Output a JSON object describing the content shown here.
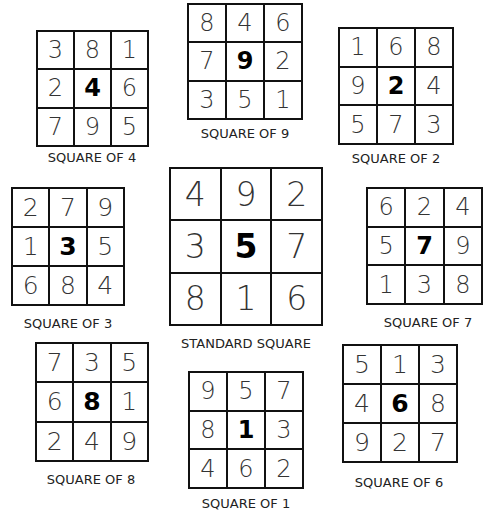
{
  "squares": [
    {
      "id": "square-of-4",
      "label": "SQUARE OF 4",
      "center": 4,
      "cells": [
        "3",
        "8",
        "1",
        "2",
        "4",
        "6",
        "7",
        "9",
        "5"
      ],
      "box": {
        "x": 36,
        "y": 30,
        "w": 113,
        "h": 117
      },
      "label_pos": {
        "x": 92,
        "y": 150
      }
    },
    {
      "id": "square-of-9",
      "label": "SQUARE OF 9",
      "center": 9,
      "cells": [
        "8",
        "4",
        "6",
        "7",
        "9",
        "2",
        "3",
        "5",
        "1"
      ],
      "box": {
        "x": 187,
        "y": 3,
        "w": 116,
        "h": 117
      },
      "label_pos": {
        "x": 245,
        "y": 126
      }
    },
    {
      "id": "square-of-2",
      "label": "SQUARE OF 2",
      "center": 2,
      "cells": [
        "1",
        "6",
        "8",
        "9",
        "2",
        "4",
        "5",
        "7",
        "3"
      ],
      "box": {
        "x": 338,
        "y": 27,
        "w": 116,
        "h": 118
      },
      "label_pos": {
        "x": 396,
        "y": 151
      }
    },
    {
      "id": "square-of-3",
      "label": "SQUARE OF 3",
      "center": 3,
      "cells": [
        "2",
        "7",
        "9",
        "1",
        "3",
        "5",
        "6",
        "8",
        "4"
      ],
      "box": {
        "x": 11,
        "y": 187,
        "w": 114,
        "h": 119
      },
      "label_pos": {
        "x": 68,
        "y": 316
      }
    },
    {
      "id": "standard-square",
      "label": "STANDARD SQUARE",
      "center": 5,
      "cells": [
        "4",
        "9",
        "2",
        "3",
        "5",
        "7",
        "8",
        "1",
        "6"
      ],
      "box": {
        "x": 169,
        "y": 167,
        "w": 154,
        "h": 159
      },
      "label_pos": {
        "x": 246,
        "y": 336
      }
    },
    {
      "id": "square-of-7",
      "label": "SQUARE OF 7",
      "center": 7,
      "cells": [
        "6",
        "2",
        "4",
        "5",
        "7",
        "9",
        "1",
        "3",
        "8"
      ],
      "box": {
        "x": 366,
        "y": 187,
        "w": 117,
        "h": 118
      },
      "label_pos": {
        "x": 428,
        "y": 315
      }
    },
    {
      "id": "square-of-8",
      "label": "SQUARE OF 8",
      "center": 8,
      "cells": [
        "7",
        "3",
        "5",
        "6",
        "8",
        "1",
        "2",
        "4",
        "9"
      ],
      "box": {
        "x": 35,
        "y": 342,
        "w": 114,
        "h": 120
      },
      "label_pos": {
        "x": 91,
        "y": 472
      }
    },
    {
      "id": "square-of-1",
      "label": "SQUARE OF 1",
      "center": 1,
      "cells": [
        "9",
        "5",
        "7",
        "8",
        "1",
        "3",
        "4",
        "6",
        "2"
      ],
      "box": {
        "x": 188,
        "y": 371,
        "w": 116,
        "h": 118
      },
      "label_pos": {
        "x": 246,
        "y": 496
      }
    },
    {
      "id": "square-of-6",
      "label": "SQUARE OF 6",
      "center": 6,
      "cells": [
        "5",
        "1",
        "3",
        "4",
        "6",
        "8",
        "9",
        "2",
        "7"
      ],
      "box": {
        "x": 342,
        "y": 344,
        "w": 116,
        "h": 119
      },
      "label_pos": {
        "x": 399,
        "y": 475
      }
    }
  ]
}
